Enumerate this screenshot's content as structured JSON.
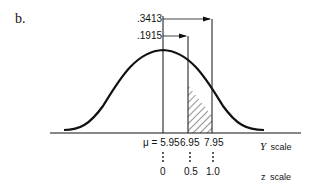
{
  "part_label": "b.",
  "probabilities": {
    "upper": ".3413",
    "lower": ".1915"
  },
  "y_scale": {
    "label_var": "Y",
    "label_word": "scale",
    "mu_label": "μ = 5.95",
    "ticks": [
      "6.95",
      "7.95"
    ]
  },
  "z_scale": {
    "label_var": "z",
    "label_word": "scale",
    "ticks": [
      "0",
      "0.5",
      "1.0"
    ]
  },
  "colors": {
    "ink": "#111111",
    "background": "#ffffff"
  }
}
